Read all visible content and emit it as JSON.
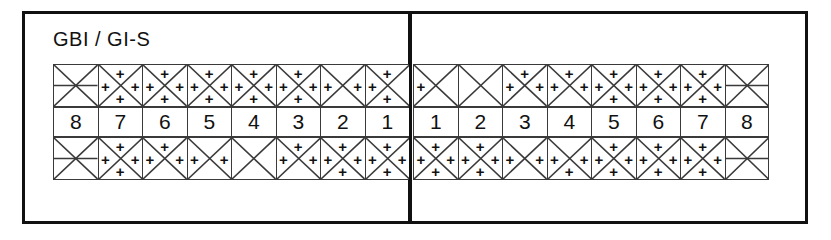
{
  "form": {
    "title": "GBI / GI-S",
    "title_parts": {
      "left": "GBI",
      "separator": "/",
      "right": "GI-S"
    }
  },
  "chart_data": {
    "type": "table",
    "title": "GBI / GI-S",
    "columns": [
      "top",
      "left",
      "right",
      "bottom"
    ],
    "rows": [
      "upper",
      "numbers",
      "lower"
    ],
    "numbers": {
      "left": [
        "8",
        "7",
        "6",
        "5",
        "4",
        "3",
        "2",
        "1"
      ],
      "right": [
        "1",
        "2",
        "3",
        "4",
        "5",
        "6",
        "7",
        "8"
      ]
    },
    "upper_left": [
      {
        "tooth": "8",
        "bar": true,
        "marks": []
      },
      {
        "tooth": "7",
        "bar": false,
        "marks": [
          "top",
          "left",
          "right",
          "bottom"
        ]
      },
      {
        "tooth": "6",
        "bar": false,
        "marks": [
          "top",
          "left",
          "right",
          "bottom"
        ]
      },
      {
        "tooth": "5",
        "bar": false,
        "marks": [
          "top",
          "left",
          "right",
          "bottom"
        ]
      },
      {
        "tooth": "4",
        "bar": false,
        "marks": [
          "top",
          "left",
          "right",
          "bottom"
        ]
      },
      {
        "tooth": "3",
        "bar": false,
        "marks": [
          "top",
          "left",
          "right",
          "bottom"
        ]
      },
      {
        "tooth": "2",
        "bar": false,
        "marks": [
          "left",
          "right"
        ]
      },
      {
        "tooth": "1",
        "bar": false,
        "marks": [
          "top",
          "left",
          "bottom"
        ]
      }
    ],
    "upper_right": [
      {
        "tooth": "1",
        "bar": false,
        "marks": [
          "left"
        ]
      },
      {
        "tooth": "2",
        "bar": false,
        "marks": []
      },
      {
        "tooth": "3",
        "bar": false,
        "marks": [
          "top",
          "left",
          "right"
        ]
      },
      {
        "tooth": "4",
        "bar": false,
        "marks": [
          "top",
          "left",
          "right"
        ]
      },
      {
        "tooth": "5",
        "bar": false,
        "marks": [
          "top",
          "left",
          "right",
          "bottom"
        ]
      },
      {
        "tooth": "6",
        "bar": false,
        "marks": [
          "top",
          "left",
          "right",
          "bottom"
        ]
      },
      {
        "tooth": "7",
        "bar": false,
        "marks": [
          "top",
          "left",
          "right",
          "bottom"
        ]
      },
      {
        "tooth": "8",
        "bar": true,
        "marks": []
      }
    ],
    "lower_left": [
      {
        "tooth": "8",
        "bar": true,
        "marks": []
      },
      {
        "tooth": "7",
        "bar": false,
        "marks": [
          "top",
          "left",
          "right",
          "bottom"
        ]
      },
      {
        "tooth": "6",
        "bar": false,
        "marks": [
          "top",
          "left",
          "right"
        ]
      },
      {
        "tooth": "5",
        "bar": false,
        "marks": [
          "left",
          "right"
        ]
      },
      {
        "tooth": "4",
        "bar": false,
        "marks": []
      },
      {
        "tooth": "3",
        "bar": false,
        "marks": [
          "top",
          "left",
          "right"
        ]
      },
      {
        "tooth": "2",
        "bar": false,
        "marks": [
          "top",
          "left",
          "right",
          "bottom"
        ]
      },
      {
        "tooth": "1",
        "bar": false,
        "marks": [
          "top",
          "left",
          "right",
          "bottom"
        ]
      }
    ],
    "lower_right": [
      {
        "tooth": "1",
        "bar": false,
        "marks": [
          "top",
          "left",
          "right",
          "bottom"
        ]
      },
      {
        "tooth": "2",
        "bar": false,
        "marks": [
          "top",
          "left",
          "right",
          "bottom"
        ]
      },
      {
        "tooth": "3",
        "bar": false,
        "marks": [
          "left",
          "right"
        ]
      },
      {
        "tooth": "4",
        "bar": false,
        "marks": [
          "left",
          "right",
          "bottom"
        ]
      },
      {
        "tooth": "5",
        "bar": false,
        "marks": [
          "top",
          "left",
          "right",
          "bottom"
        ]
      },
      {
        "tooth": "6",
        "bar": false,
        "marks": [
          "top",
          "left",
          "right",
          "bottom"
        ]
      },
      {
        "tooth": "7",
        "bar": false,
        "marks": [
          "top",
          "left",
          "right",
          "bottom"
        ]
      },
      {
        "tooth": "8",
        "bar": true,
        "marks": []
      }
    ],
    "mark_glyph": "+",
    "colors": {
      "ink": "#111111",
      "grid": "#3a3a3a",
      "paper": "#ffffff"
    }
  }
}
